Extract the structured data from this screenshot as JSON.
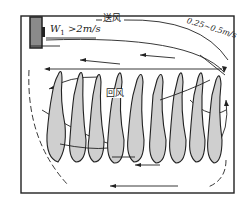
{
  "diagram": {
    "labels": {
      "supply_air": "送风",
      "inlet_velocity_prefix": "W",
      "inlet_velocity_sub": "1",
      "inlet_velocity_value": " >2m/s",
      "return_air": "回风",
      "velocity_range": "0.25~0.5m/s"
    },
    "elements": {
      "fan_unit": "air supply unit",
      "plant_rows": 9
    },
    "colors": {
      "line": "#222222",
      "leaf_fill": "#cfcfcf",
      "fan_fill": "#8a8a8a",
      "background": "#ffffff"
    }
  }
}
